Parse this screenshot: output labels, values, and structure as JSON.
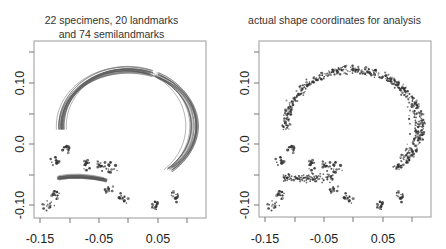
{
  "chart_data": [
    {
      "type": "line",
      "title": "22 specimens, 20 landmarks and 74 semilandmarks",
      "title_lines": [
        "22 specimens, 20 landmarks",
        "and 74 semilandmarks"
      ],
      "xlabel": "",
      "ylabel": "",
      "x_ticks": [
        "-0.15",
        "-0.05",
        "0.05"
      ],
      "y_ticks": [
        "-0.10",
        "0.0",
        "0.10"
      ],
      "xlim": [
        -0.16,
        0.14
      ],
      "ylim": [
        -0.12,
        0.17
      ],
      "grid": false,
      "description": "Superimposed outlines (curves) of 22 specimens: a large arch of semilandmark curves from about (-0.10, 0.0) up through (0.0, 0.07) down to (0.10, -0.08), plus clusters of landmark points near the base.",
      "landmark_clusters": [
        {
          "x": -0.125,
          "y": -0.03
        },
        {
          "x": -0.07,
          "y": -0.035
        },
        {
          "x": -0.045,
          "y": -0.035
        },
        {
          "x": -0.028,
          "y": -0.04
        },
        {
          "x": -0.035,
          "y": -0.075
        },
        {
          "x": -0.01,
          "y": -0.09
        },
        {
          "x": 0.045,
          "y": -0.1
        },
        {
          "x": -0.125,
          "y": -0.085
        },
        {
          "x": -0.135,
          "y": -0.1
        },
        {
          "x": 0.08,
          "y": -0.085
        },
        {
          "x": -0.105,
          "y": -0.005
        }
      ]
    },
    {
      "type": "scatter",
      "title": "actual shape coordinates for analysis",
      "xlabel": "",
      "ylabel": "",
      "x_ticks": [
        "-0.15",
        "-0.05",
        "0.05"
      ],
      "y_ticks": [
        "-0.10",
        "0.0",
        "0.10"
      ],
      "xlim": [
        -0.16,
        0.14
      ],
      "ylim": [
        -0.12,
        0.17
      ],
      "grid": false,
      "description": "Procrustes-aligned shape coordinates plotted as points: dense arch of semilandmark points and landmark clusters matching the left panel."
    }
  ],
  "panels": {
    "left": {
      "title_line1": "22 specimens, 20 landmarks",
      "title_line2": "and 74 semilandmarks",
      "x_tick_labels": [
        "-0.15",
        "-0.05",
        "0.05"
      ],
      "y_tick_labels": [
        "-0.10",
        "0.0",
        "0.10"
      ]
    },
    "right": {
      "title_line1": "actual shape coordinates for analysis",
      "x_tick_labels": [
        "-0.15",
        "-0.05",
        "0.05"
      ],
      "y_tick_labels": [
        "-0.10",
        "0.0",
        "0.10"
      ]
    }
  },
  "colors": {
    "frame": "#9a9a9a",
    "curve": "#555555",
    "points": "#333333"
  }
}
